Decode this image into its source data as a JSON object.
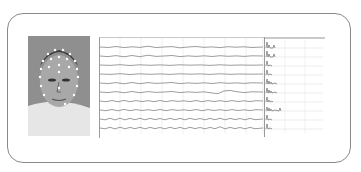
{
  "figure": {
    "panels": [
      {
        "id": "photo",
        "content": "person wearing EEG electrode cap"
      },
      {
        "id": "eeg_traces",
        "channel_count": 10
      },
      {
        "id": "spectra",
        "channel_count": 10
      }
    ]
  },
  "eeg": {
    "channels": 10,
    "x_ticks": [
      "",
      "",
      "",
      "",
      "",
      "",
      "",
      ""
    ]
  },
  "spectra": {
    "header": ""
  },
  "colors": {
    "frame": "#8a8a8a",
    "trace": "#555555",
    "grid": "#d8d8d8",
    "background": "#ffffff"
  }
}
